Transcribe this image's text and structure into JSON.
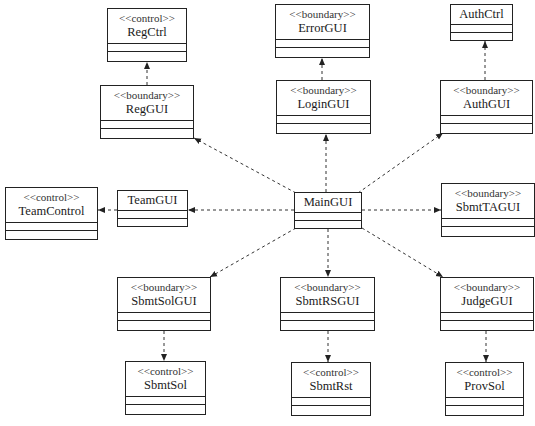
{
  "diagram": {
    "type": "UML class diagram",
    "classes": {
      "RegCtrl": {
        "stereotype": "<<control>>",
        "name": "RegCtrl"
      },
      "RegGUI": {
        "stereotype": "<<boundary>>",
        "name": "RegGUI"
      },
      "ErrorGUI": {
        "stereotype": "<<boundary>>",
        "name": "ErrorGUI"
      },
      "LoginGUI": {
        "stereotype": "<<boundary>>",
        "name": "LoginGUI"
      },
      "AuthCtrl": {
        "stereotype": "",
        "name": "AuthCtrl"
      },
      "AuthGUI": {
        "stereotype": "<<boundary>>",
        "name": "AuthGUI"
      },
      "TeamControl": {
        "stereotype": "<<control>>",
        "name": "TeamControl"
      },
      "TeamGUI": {
        "stereotype": "",
        "name": "TeamGUI"
      },
      "MainGUI": {
        "stereotype": "",
        "name": "MainGUI"
      },
      "SbmtTAGUI": {
        "stereotype": "<<boundary>>",
        "name": "SbmtTAGUI"
      },
      "SbmtSolGUI": {
        "stereotype": "<<boundary>>",
        "name": "SbmtSolGUI"
      },
      "SbmtRSGUI": {
        "stereotype": "<<boundary>>",
        "name": "SbmtRSGUI"
      },
      "JudgeGUI": {
        "stereotype": "<<boundary>>",
        "name": "JudgeGUI"
      },
      "SbmtSol": {
        "stereotype": "<<control>>",
        "name": "SbmtSol"
      },
      "SbmtRst": {
        "stereotype": "<<control>>",
        "name": "SbmtRst"
      },
      "ProvSol": {
        "stereotype": "<<control>>",
        "name": "ProvSol"
      }
    },
    "dependencies": [
      {
        "from": "MainGUI",
        "to": "RegGUI"
      },
      {
        "from": "MainGUI",
        "to": "LoginGUI"
      },
      {
        "from": "MainGUI",
        "to": "AuthGUI"
      },
      {
        "from": "MainGUI",
        "to": "TeamGUI"
      },
      {
        "from": "MainGUI",
        "to": "SbmtTAGUI"
      },
      {
        "from": "MainGUI",
        "to": "SbmtSolGUI"
      },
      {
        "from": "MainGUI",
        "to": "SbmtRSGUI"
      },
      {
        "from": "MainGUI",
        "to": "JudgeGUI"
      },
      {
        "from": "RegGUI",
        "to": "RegCtrl"
      },
      {
        "from": "LoginGUI",
        "to": "ErrorGUI"
      },
      {
        "from": "AuthGUI",
        "to": "AuthCtrl"
      },
      {
        "from": "TeamGUI",
        "to": "TeamControl"
      },
      {
        "from": "SbmtSolGUI",
        "to": "SbmtSol"
      },
      {
        "from": "SbmtRSGUI",
        "to": "SbmtRst"
      },
      {
        "from": "JudgeGUI",
        "to": "ProvSol"
      }
    ],
    "colors": {
      "line": "#222222",
      "background": "#ffffff"
    }
  }
}
